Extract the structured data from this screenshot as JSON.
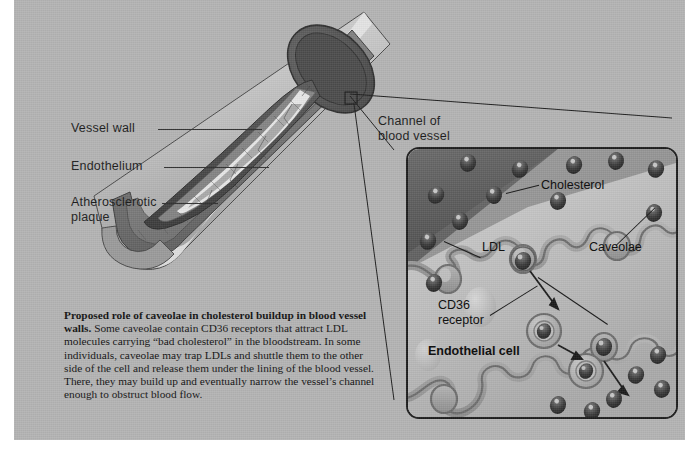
{
  "figure": {
    "background_color": "#b3b3b3",
    "ink_color": "#1b1b1b"
  },
  "vessel_labels": [
    {
      "id": "vessel-wall",
      "text": "Vessel wall"
    },
    {
      "id": "endothelium",
      "text": "Endothelium"
    },
    {
      "id": "atherosclerotic-plaque",
      "line1": "Atherosclerotic",
      "line2": "plaque"
    }
  ],
  "callout": {
    "channel_label_line1": "Channel of",
    "channel_label_line2": "blood vessel"
  },
  "inset_labels": {
    "ldl": "LDL",
    "cholesterol": "Cholesterol",
    "caveolae": "Caveolae",
    "cd36_line1": "CD36",
    "cd36_line2": "receptor",
    "endothelial_cell": "Endothelial cell"
  },
  "caption": {
    "headline": "Proposed role of caveolae in cholesterol buildup in blood vessel walls.",
    "body": " Some caveolae contain CD36 receptors that attract LDL molecules carrying “bad cholesterol” in the bloodstream. In some individuals, caveolae may trap LDLs and shuttle them to the other side of the cell and release them under the lining of the blood vessel. There, they may build up and eventually narrow the vessel’s channel enough to obstruct blood flow."
  }
}
